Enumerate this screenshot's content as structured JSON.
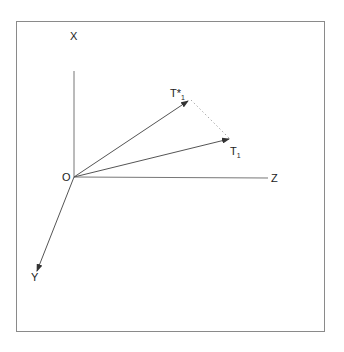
{
  "figure": {
    "type": "3d-axis-vector-diagram",
    "origin_label": "O",
    "axes": [
      {
        "name": "X",
        "label": "X",
        "direction": "up"
      },
      {
        "name": "Y",
        "label": "Y",
        "direction": "down-left"
      },
      {
        "name": "Z",
        "label": "Z",
        "direction": "right"
      }
    ],
    "vectors": [
      {
        "name": "T*1",
        "label_main": "T*",
        "label_sub": "1",
        "from": "O"
      },
      {
        "name": "T1",
        "label_main": "T",
        "label_sub": "1",
        "from": "O"
      }
    ],
    "connector": {
      "from": "T*1",
      "to": "T1",
      "style": "dotted"
    },
    "colors": {
      "line": "#555555",
      "frame": "#8a8a8a",
      "text": "#222222",
      "dotted": "#aaaaaa"
    }
  }
}
